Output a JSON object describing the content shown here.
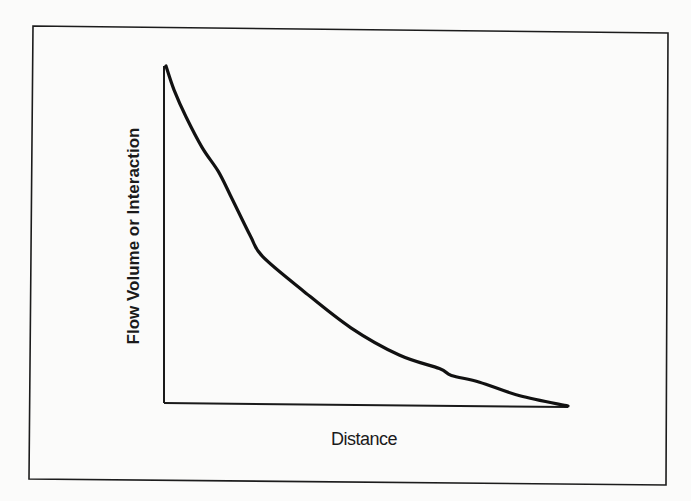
{
  "chart_data": {
    "type": "line",
    "title": "",
    "subtitle": "",
    "xlabel": "Distance",
    "ylabel": "Flow Volume or Interaction",
    "x_ticks": [],
    "y_ticks": [],
    "grid": false,
    "legend": null,
    "xlim": [
      0,
      1
    ],
    "ylim": [
      0,
      1
    ],
    "note": "Conceptual distance-decay curve; no numeric scale shown. Values normalized 0-1.",
    "series": [
      {
        "name": "Distance decay",
        "x": [
          0.0,
          0.02,
          0.05,
          0.09,
          0.13,
          0.16,
          0.21,
          0.24,
          0.34,
          0.46,
          0.58,
          0.68,
          0.71,
          0.78,
          0.88,
          1.0
        ],
        "y": [
          1.0,
          0.93,
          0.85,
          0.76,
          0.69,
          0.62,
          0.5,
          0.44,
          0.34,
          0.23,
          0.15,
          0.11,
          0.09,
          0.07,
          0.03,
          0.0
        ]
      }
    ]
  },
  "labels": {
    "x_axis": "Distance",
    "y_axis": "Flow Volume or Interaction"
  }
}
